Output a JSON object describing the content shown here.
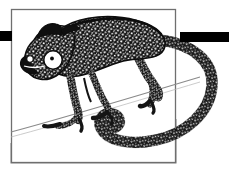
{
  "image": {
    "title": "Chameleon line-art illustration",
    "subject": "chameleon",
    "style": "stippled pen-and-ink line art",
    "width": 233,
    "height": 172,
    "background_color": "#ffffff",
    "ink_color": "#111111",
    "stipple_highlight_color": "#ffffff",
    "frame_line_color": "#6b6b6b",
    "branch_line_color": "#8a8a8a"
  },
  "elements": {
    "frame": {
      "name": "inner rectangular frame",
      "x": 11,
      "y": 9,
      "width": 165,
      "height": 154,
      "stroke_width": 1.2
    },
    "left_bar": {
      "name": "left black bar",
      "x": 0,
      "y": 31,
      "width": 12,
      "height": 10,
      "color": "#000000"
    },
    "right_bar": {
      "name": "right black bar",
      "x": 180,
      "y": 32,
      "width": 49,
      "height": 10,
      "color": "#000000"
    },
    "slab": {
      "name": "lower-left quadrilateral slab",
      "points": "11,143 11,163 176,163 176,119",
      "stroke": "#8a8a8a"
    },
    "branch": {
      "name": "diagonal branch line",
      "from_x": 11,
      "from_y": 131,
      "to_x": 197,
      "to_y": 78
    },
    "eye": {
      "name": "chameleon eye",
      "center_x": 53,
      "center_y": 60,
      "radius": 9,
      "sclera_color": "#ffffff",
      "pupil_color": "#111111",
      "pupil_radius": 1.8
    },
    "secondary_eye_spot": {
      "name": "small white spot near snout",
      "center_x": 30,
      "center_y": 59,
      "radius": 3
    }
  },
  "labels": {
    "alt_text": "Black and white stippled drawing of a chameleon gripping a branch, its long tail curled in a spiral, enclosed in a thin rectangle with black bars extending left and right."
  }
}
